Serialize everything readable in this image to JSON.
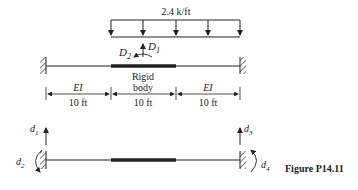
{
  "load": {
    "label": "2.4 k/ft"
  },
  "dofs_top": {
    "d1": "D",
    "d1_sub": "1",
    "d2": "D",
    "d2_sub": "2"
  },
  "segments": [
    {
      "label": "EI",
      "length": "10 ft"
    },
    {
      "label": "Rigid",
      "label2": "body",
      "length": "10 ft"
    },
    {
      "label": "EI",
      "length": "10 ft"
    }
  ],
  "dofs_bottom": {
    "d1": "d",
    "d1_sub": "1",
    "d2": "d",
    "d2_sub": "2",
    "d3": "d",
    "d3_sub": "3",
    "d4": "d",
    "d4_sub": "4"
  },
  "caption": "Figure P14.11",
  "colors": {
    "ink": "#222222"
  }
}
